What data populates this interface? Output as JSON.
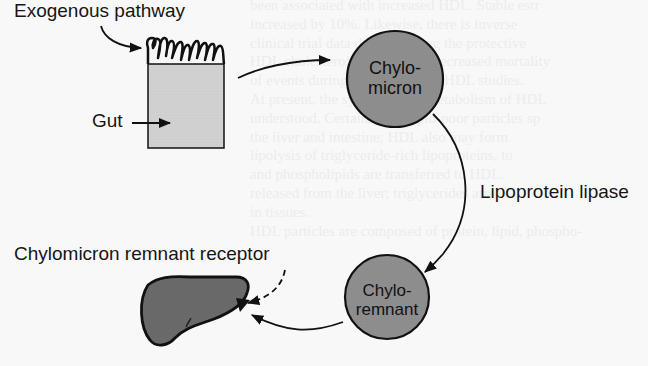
{
  "diagram": {
    "labels": {
      "exogenous_pathway": "Exogenous pathway",
      "gut": "Gut",
      "lipoprotein_lipase": "Lipoprotein lipase",
      "remnant_receptor": "Chylomicron remnant receptor"
    },
    "nodes": {
      "chylomicron": {
        "line1": "Chylo-",
        "line2": "micron"
      },
      "remnant": {
        "line1": "Chylo-",
        "line2": "remnant"
      }
    },
    "edges": [
      {
        "from": "gut",
        "to": "chylomicron",
        "style": "solid"
      },
      {
        "from": "chylomicron",
        "to": "remnant",
        "style": "solid",
        "label": "Lipoprotein lipase"
      },
      {
        "from": "remnant",
        "to": "liver",
        "style": "solid"
      },
      {
        "from": "remnant_receptor_label",
        "to": "liver",
        "style": "dashed"
      }
    ],
    "colors": {
      "gut_fill": "#d0d0d0",
      "node_fill": "#8c8c8c",
      "liver_fill": "#6a6a6a",
      "stroke": "#111111"
    }
  },
  "background_text": [
    "been associated with increased HDL. Stable estr",
    "increased by 10%. Likewise, there is inverse",
    "clinical trial data demonstrating the protective",
    "HDL cholesterol significantly decreased mortality",
    "of events during cross-sectional HDL studies.",
    "     At present, the synthesis and metabolism of HDL",
    "understood. Certainly, the lipid-poor particles sp",
    "the liver and intestine; HDL also may form",
    "lipolysis of triglyceride-rich lipoproteins, to",
    "and phospholipids are transferred to HDL.",
    "released from the liver; triglycerides are",
    "in tissues.",
    "     HDL particles are composed of protein, lipid, phospho-"
  ]
}
